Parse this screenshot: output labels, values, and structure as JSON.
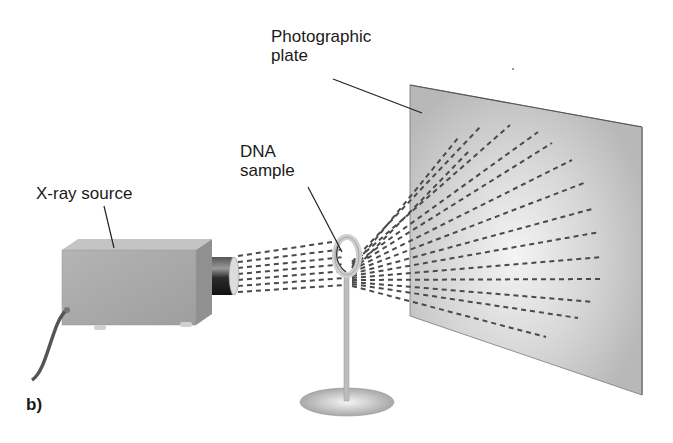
{
  "figure": {
    "panel_label": "b)"
  },
  "labels": {
    "photographic_plate": {
      "line1": "Photographic",
      "line2": "plate"
    },
    "dna_sample": {
      "line1": "DNA",
      "line2": "sample"
    },
    "xray_source": "X-ray source"
  },
  "colors": {
    "plate_fill": "#c8c8c8",
    "plate_highlight": "#f2f2f2",
    "box_fill": "#a9a9a9",
    "box_top": "#bdbdbd",
    "tube_dark": "#2a2a2a",
    "dash": "#4a4a4a",
    "text": "#1a1a1a"
  }
}
